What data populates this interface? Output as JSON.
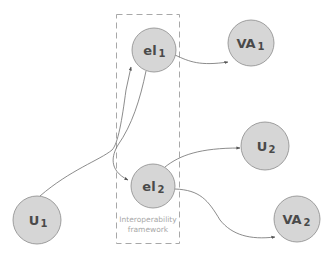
{
  "diagram": {
    "colors": {
      "node_fill": "#d6d6d6",
      "node_stroke": "#8a8a8a",
      "edge": "#6e6e6e",
      "frame": "#a8a8a8",
      "label": "#4a4a4a",
      "frame_label": "#a8a8a8"
    },
    "frame": {
      "label_line1": "Interoperability",
      "label_line2": "framework"
    },
    "nodes": {
      "el1": {
        "main": "el",
        "sub": "1"
      },
      "el2": {
        "main": "el",
        "sub": "2"
      },
      "va1": {
        "main": "VA",
        "sub": "1"
      },
      "va2": {
        "main": "VA",
        "sub": "2"
      },
      "u1": {
        "main": "U",
        "sub": "1"
      },
      "u2": {
        "main": "U",
        "sub": "2"
      }
    },
    "edges": [
      {
        "from": "U1",
        "to": "el1"
      },
      {
        "from": "el1",
        "to": "el2"
      },
      {
        "from": "el1",
        "to": "VA1"
      },
      {
        "from": "el2",
        "to": "U2"
      },
      {
        "from": "el2",
        "to": "VA2"
      }
    ]
  }
}
